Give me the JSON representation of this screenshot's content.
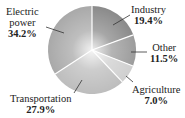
{
  "chart_data": {
    "type": "pie",
    "title": "",
    "categories": [
      "Industry",
      "Other",
      "Agriculture",
      "Transportation",
      "Electric power"
    ],
    "values": [
      19.4,
      11.5,
      7.0,
      27.9,
      34.2
    ],
    "value_labels": [
      "19.4%",
      "11.5%",
      "7.0%",
      "27.9%",
      "34.2%"
    ],
    "start_angle": "12 o'clock",
    "direction": "clockwise",
    "colors": [
      "#8a8a8a",
      "#9c9c9c",
      "#cfcfcf",
      "#bdbdbd",
      "#a9a9a9"
    ],
    "legend": "none (direct labels with leader lines)"
  },
  "labels": {
    "industry": {
      "name": "Industry",
      "value": "19.4%"
    },
    "other": {
      "name": "Other",
      "value": "11.5%"
    },
    "agriculture": {
      "name": "Agriculture",
      "value": "7.0%"
    },
    "transportation": {
      "name": "Transportation",
      "value": "27.9%"
    },
    "electric_line1": "Electric",
    "electric_line2": "power",
    "electric_value": "34.2%"
  }
}
